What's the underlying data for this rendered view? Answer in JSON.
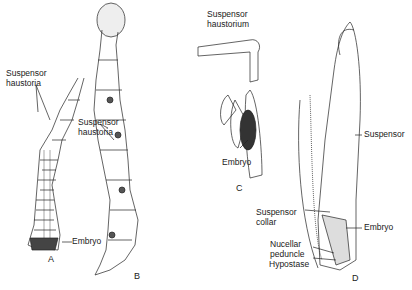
{
  "figure": {
    "panels": [
      {
        "id": "A",
        "labels": [
          "Suspensor\nhaustoria",
          "Embryo"
        ]
      },
      {
        "id": "B",
        "labels": [
          "Suspensor\nhaustoria"
        ]
      },
      {
        "id": "C",
        "labels": [
          "Suspensor\nhaustorium",
          "Embryo"
        ]
      },
      {
        "id": "D",
        "labels": [
          "Suspensor",
          "Suspensor\ncollar",
          "Embryo",
          "Nucellar\npeduncle",
          "Hypostase"
        ]
      }
    ]
  }
}
